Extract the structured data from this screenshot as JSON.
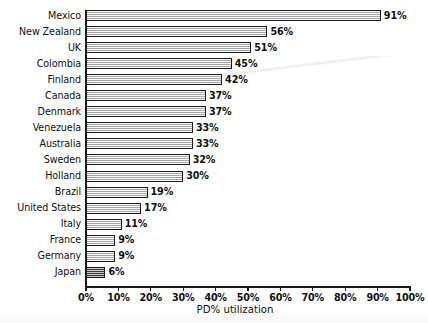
{
  "chart_data": {
    "type": "bar",
    "orientation": "horizontal",
    "title": "",
    "xlabel": "PD% utilization",
    "ylabel": "",
    "xlim": [
      0,
      100
    ],
    "grid": false,
    "legend": null,
    "xtick_labels": [
      "0%",
      "10%",
      "20%",
      "30%",
      "40%",
      "50%",
      "60%",
      "70%",
      "80%",
      "90%",
      "100%"
    ],
    "xtick_values": [
      0,
      10,
      20,
      30,
      40,
      50,
      60,
      70,
      80,
      90,
      100
    ],
    "categories": [
      "Mexico",
      "New Zealand",
      "UK",
      "Colombia",
      "Finland",
      "Canada",
      "Denmark",
      "Venezuela",
      "Australia",
      "Sweden",
      "Holland",
      "Brazil",
      "United States",
      "Italy",
      "France",
      "Germany",
      "Japan"
    ],
    "values": [
      91,
      56,
      51,
      45,
      42,
      37,
      37,
      33,
      33,
      32,
      30,
      19,
      17,
      11,
      9,
      9,
      6
    ],
    "value_labels": [
      "91%",
      "56%",
      "51%",
      "45%",
      "42%",
      "37%",
      "37%",
      "33%",
      "33%",
      "32%",
      "30%",
      "19%",
      "17%",
      "11%",
      "9%",
      "9%",
      "6%"
    ],
    "bar_styles": [
      "hatch",
      "hatch",
      "hatch",
      "hatch",
      "hatch",
      "hatch",
      "hatch",
      "hatch",
      "hatch",
      "hatch",
      "hatch",
      "hatch",
      "hatch",
      "hatch",
      "hatch",
      "hatch",
      "dense"
    ],
    "colors": {
      "bar_fill": "#cfcfcf",
      "bar_fill_dense": "#9a9a9a",
      "bar_edge": "#1c1c1c",
      "axis": "#1a1a1a",
      "text": "#101010",
      "background": "#ffffff"
    }
  }
}
